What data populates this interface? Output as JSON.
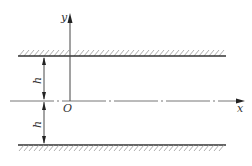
{
  "diagram": {
    "axes": {
      "x_label": "x",
      "y_label": "y",
      "origin_label": "O"
    },
    "dimensions": {
      "upper_half_label": "h",
      "lower_half_label": "h"
    },
    "colors": {
      "line": "#333333",
      "hatch": "#888888",
      "centerline": "#777777"
    }
  }
}
